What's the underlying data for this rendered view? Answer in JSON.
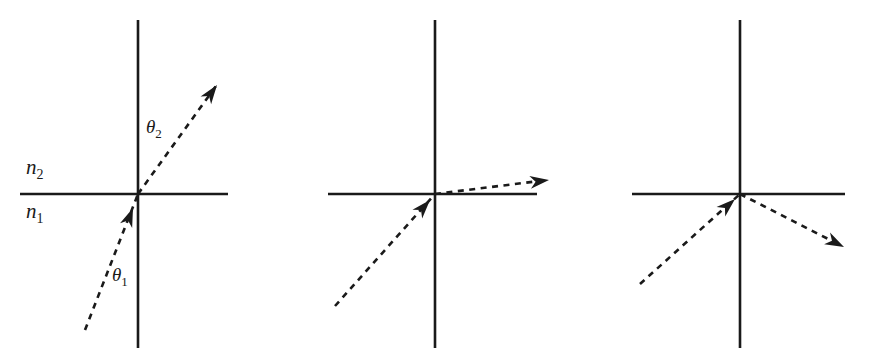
{
  "figure": {
    "width": 881,
    "height": 361,
    "background_color": "#ffffff",
    "stroke_color": "#1a1a1a"
  },
  "labels": {
    "medium_upper": "n",
    "medium_upper_sub": "2",
    "medium_lower": "n",
    "medium_lower_sub": "1",
    "angle_refracted": "θ",
    "angle_refracted_sub": "2",
    "angle_incident": "θ",
    "angle_incident_sub": "1"
  },
  "panels": [
    {
      "id": "panel-partial-refraction",
      "name": "Refraction below critical angle",
      "origin": {
        "x": 138,
        "y": 194
      },
      "interface": {
        "x1": 20,
        "x2": 228,
        "y": 194
      },
      "normal": {
        "x": 138,
        "y1": 20,
        "y2": 348
      },
      "incident_ray": {
        "x1": 85,
        "y1": 330,
        "x2": 138,
        "y2": 194
      },
      "incident_arrow_at": {
        "x": 131,
        "y": 214
      },
      "incident_arrow_angle_deg": -68.7,
      "refracted_ray": {
        "x1": 138,
        "y1": 194,
        "x2": 216,
        "y2": 86
      },
      "refracted_arrow_at": {
        "x": 216,
        "y": 86
      },
      "refracted_arrow_angle_deg": -54.1,
      "has_medium_labels": true,
      "has_angle_labels": true
    },
    {
      "id": "panel-critical-angle",
      "name": "Refraction at the critical angle",
      "origin": {
        "x": 435,
        "y": 194
      },
      "interface": {
        "x1": 328,
        "x2": 537,
        "y": 194
      },
      "normal": {
        "x": 435,
        "y1": 20,
        "y2": 348
      },
      "incident_ray": {
        "x1": 335,
        "y1": 306,
        "x2": 435,
        "y2": 194
      },
      "incident_arrow_at": {
        "x": 425,
        "y": 206
      },
      "incident_arrow_angle_deg": -48.2,
      "refracted_ray": {
        "x1": 435,
        "y1": 194,
        "x2": 547,
        "y2": 180
      },
      "refracted_arrow_at": {
        "x": 547,
        "y": 180
      },
      "refracted_arrow_angle_deg": -7.1,
      "has_medium_labels": false,
      "has_angle_labels": false
    },
    {
      "id": "panel-total-internal-reflection",
      "name": "Total internal reflection above the critical angle",
      "origin": {
        "x": 740,
        "y": 194
      },
      "interface": {
        "x1": 632,
        "x2": 845,
        "y": 194
      },
      "normal": {
        "x": 740,
        "y1": 20,
        "y2": 348
      },
      "incident_ray": {
        "x1": 640,
        "y1": 284,
        "x2": 740,
        "y2": 194
      },
      "incident_arrow_at": {
        "x": 727,
        "y": 206
      },
      "incident_arrow_angle_deg": -42.0,
      "refracted_ray": {
        "x1": 740,
        "y1": 194,
        "x2": 842,
        "y2": 246
      },
      "refracted_arrow_at": {
        "x": 842,
        "y": 246
      },
      "refracted_arrow_angle_deg": 27.0,
      "has_medium_labels": false,
      "has_angle_labels": false
    }
  ],
  "label_positions": {
    "n2": {
      "x": 26,
      "y": 174
    },
    "n1": {
      "x": 26,
      "y": 216
    },
    "theta2": {
      "x": 144,
      "y": 132
    },
    "theta1": {
      "x": 112,
      "y": 281
    }
  }
}
